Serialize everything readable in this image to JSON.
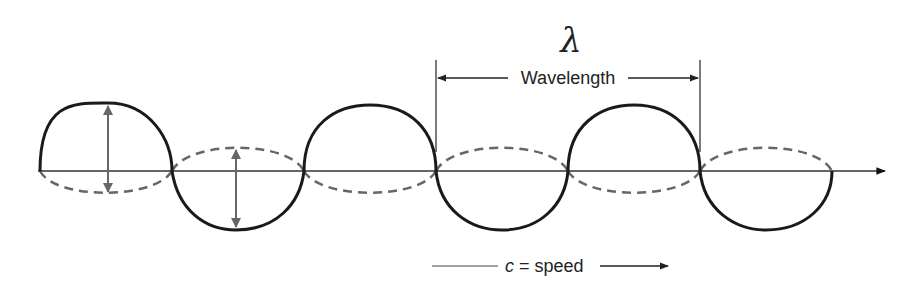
{
  "diagram": {
    "title_symbol": "λ",
    "wavelength_label": "Wavelength",
    "speed_label_var": "c",
    "speed_label_rest": " = speed",
    "colors": {
      "wave_solid": "#1a1a1a",
      "wave_dashed": "#666666",
      "axis": "#333333",
      "amplitude_arrow": "#666666",
      "background": "#ffffff"
    },
    "axis": {
      "y": 171,
      "x_start": 38,
      "x_end": 885
    },
    "zero_crossings": [
      40,
      172,
      304,
      436,
      568,
      700,
      832
    ],
    "solid_wave_lobes": [
      "up",
      "down",
      "up",
      "down",
      "up",
      "down"
    ],
    "dashed_wave_lobes": [
      "down",
      "up",
      "down",
      "up",
      "down",
      "up"
    ],
    "wavelength_span": {
      "x1": 436,
      "x2": 700
    },
    "amplitude_arrows": [
      {
        "x": 108,
        "y1": 104,
        "y2": 193
      },
      {
        "x": 236,
        "y1": 148,
        "y2": 229
      }
    ]
  }
}
